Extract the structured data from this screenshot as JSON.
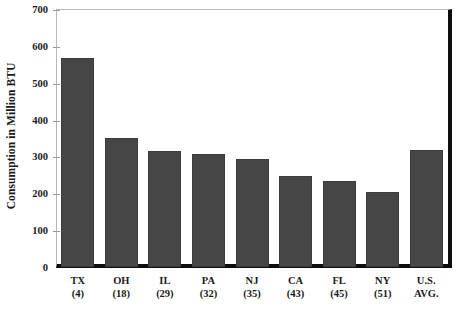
{
  "chart_data": {
    "type": "bar",
    "title": "",
    "subtitle": "",
    "xlabel": "",
    "ylabel": "Consumption in Million BTU",
    "ylim": [
      0,
      700
    ],
    "ytick_values": [
      700,
      600,
      500,
      400,
      300,
      200,
      100,
      0
    ],
    "ytick_labels": [
      "700",
      "600",
      "500",
      "400",
      "300",
      "200",
      "100",
      "0"
    ],
    "grid": false,
    "legend": false,
    "legend_position": "none",
    "bar_color": "#464646",
    "categories": [
      "TX",
      "OH",
      "IL",
      "PA",
      "NJ",
      "CA",
      "FL",
      "NY",
      "U.S."
    ],
    "category_sublabels": [
      "(4)",
      "(18)",
      "(29)",
      "(32)",
      "(35)",
      "(43)",
      "(45)",
      "(51)",
      "AVG."
    ],
    "values": [
      567,
      351,
      315,
      307,
      292,
      248,
      233,
      203,
      317
    ],
    "series": [
      {
        "name": "Consumption in Million BTU",
        "values": [
          567,
          351,
          315,
          307,
          292,
          248,
          233,
          203,
          317
        ]
      }
    ]
  },
  "axis": {
    "y_title": "Consumption in Million BTU"
  }
}
